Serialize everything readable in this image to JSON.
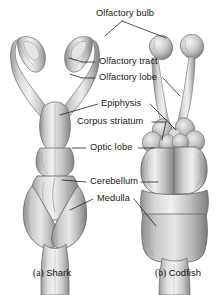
{
  "figure": {
    "background_color": "#ffffff",
    "line_color": "#1a1a1a",
    "tissue_colors": {
      "highlight": "#f2f2f2",
      "light": "#dcdcdc",
      "mid": "#b4b4b4",
      "shadow": "#8a8a8a",
      "deep_shadow": "#6e6e6e",
      "outline": "#5a5a5a"
    }
  },
  "labels": {
    "olfactory_bulb": "Olfactory bulb",
    "olfactory_tract": "Olfactory tract",
    "olfactory_lobe": "Olfactory lobe",
    "epiphysis": "Epiphysis",
    "corpus_striatum": "Corpus striatum",
    "optic_lobe": "Optic lobe",
    "cerebellum": "Cerebellum",
    "medulla": "Medulla"
  },
  "captions": {
    "a_index": "(a)",
    "a_name": "Shark",
    "b_index": "(b)",
    "b_name": "Codfish"
  },
  "specimens": [
    {
      "id": "shark",
      "label": "(a) Shark",
      "side": "left"
    },
    {
      "id": "codfish",
      "label": "(b) Codfish",
      "side": "right"
    }
  ],
  "structures": [
    {
      "name": "Olfactory bulb",
      "present_in": [
        "shark",
        "codfish"
      ]
    },
    {
      "name": "Olfactory tract",
      "present_in": [
        "shark",
        "codfish"
      ]
    },
    {
      "name": "Olfactory lobe",
      "present_in": [
        "shark",
        "codfish"
      ]
    },
    {
      "name": "Epiphysis",
      "present_in": [
        "codfish"
      ]
    },
    {
      "name": "Corpus striatum",
      "present_in": [
        "codfish"
      ]
    },
    {
      "name": "Optic lobe",
      "present_in": [
        "shark",
        "codfish"
      ]
    },
    {
      "name": "Cerebellum",
      "present_in": [
        "shark",
        "codfish"
      ]
    },
    {
      "name": "Medulla",
      "present_in": [
        "shark",
        "codfish"
      ]
    }
  ]
}
